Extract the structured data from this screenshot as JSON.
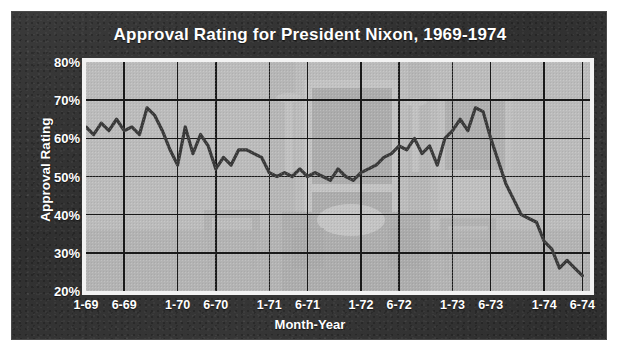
{
  "figure": {
    "background_color": "#ffffff",
    "card_color": "#333333",
    "plot_background_color": "#b9b9b9",
    "line_color": "#3a3a3a",
    "grid_color": "#1a1a1a",
    "text_color": "#ffffff"
  },
  "chart_data": {
    "type": "line",
    "title": "Approval Rating for President Nixon, 1969-1974",
    "xlabel": "Month-Year",
    "ylabel": "Approval Rating",
    "ylim": [
      20,
      80
    ],
    "xlim": [
      0,
      66
    ],
    "grid": true,
    "legend_position": "none",
    "ytick_labels": [
      "80%",
      "70%",
      "60%",
      "50%",
      "40%",
      "30%",
      "20%"
    ],
    "ytick_values": [
      80,
      70,
      60,
      50,
      40,
      30,
      20
    ],
    "xtick_labels": [
      "1-69",
      "6-69",
      "1-70",
      "6-70",
      "1-71",
      "6-71",
      "1-72",
      "6-72",
      "1-73",
      "6-73",
      "1-74",
      "6-74"
    ],
    "xtick_values": [
      0,
      5,
      12,
      17,
      24,
      29,
      36,
      41,
      48,
      53,
      60,
      65
    ],
    "series": [
      {
        "name": "Approval Rating",
        "x": [
          0,
          1,
          2,
          3,
          4,
          5,
          6,
          7,
          8,
          9,
          10,
          11,
          12,
          13,
          14,
          15,
          16,
          17,
          18,
          19,
          20,
          21,
          22,
          23,
          24,
          25,
          26,
          27,
          28,
          29,
          30,
          31,
          32,
          33,
          34,
          35,
          36,
          37,
          38,
          39,
          40,
          41,
          42,
          43,
          44,
          45,
          46,
          47,
          48,
          49,
          50,
          51,
          52,
          53,
          54,
          55,
          56,
          57,
          58,
          59,
          60,
          61,
          62,
          63,
          64,
          65
        ],
        "values": [
          63,
          61,
          64,
          62,
          65,
          62,
          63,
          61,
          68,
          66,
          62,
          57,
          53,
          63,
          56,
          61,
          58,
          52,
          55,
          53,
          57,
          57,
          56,
          55,
          51,
          50,
          51,
          50,
          52,
          50,
          51,
          50,
          49,
          52,
          50,
          49,
          51,
          52,
          53,
          55,
          56,
          58,
          57,
          60,
          56,
          58,
          53,
          60,
          62,
          65,
          62,
          68,
          67,
          60,
          54,
          48,
          44,
          40,
          39,
          38,
          33,
          31,
          26,
          28,
          26,
          24
        ]
      }
    ]
  },
  "background_watermark": {
    "description": "faint photo of a presidential office interior behind the plot",
    "elements": [
      "window",
      "armchair-left",
      "desk",
      "armchair-right",
      "lamp-left",
      "lamp-right"
    ]
  }
}
